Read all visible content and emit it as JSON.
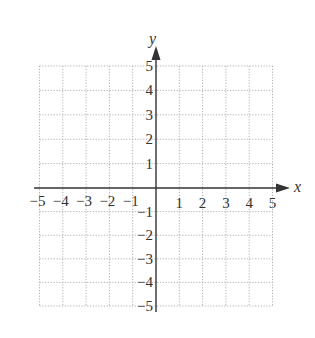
{
  "chart_data": {
    "type": "scatter",
    "title": "",
    "xlabel": "x",
    "ylabel": "y",
    "xlim": [
      -5,
      5
    ],
    "ylim": [
      -5,
      5
    ],
    "grid": true,
    "grid_style": "dotted",
    "x_ticks": [
      "-5",
      "-4",
      "-3",
      "-2",
      "-1",
      "1",
      "2",
      "3",
      "4",
      "5"
    ],
    "y_ticks": [
      "5",
      "4",
      "3",
      "2",
      "1",
      "-1",
      "-2",
      "-3",
      "-4",
      "-5"
    ],
    "series": [],
    "colors": {
      "axis": "#333333",
      "grid": "#b0b0b0",
      "background": "#ffffff"
    }
  }
}
